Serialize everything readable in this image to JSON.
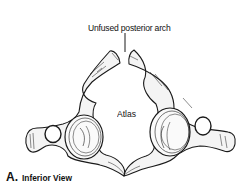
{
  "figure": {
    "labels": {
      "top": "Unfused posterior arch",
      "center": "Atlas"
    },
    "caption": {
      "letter": "A.",
      "text": "Inferior View"
    },
    "colors": {
      "line": "#1a1a1a",
      "bone_fill": "#f4f4f4",
      "background": "#ffffff"
    }
  }
}
